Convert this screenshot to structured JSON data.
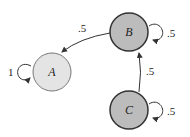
{
  "diagram": {
    "type": "markov-chain",
    "nodes": [
      {
        "id": "A",
        "label": "A",
        "fill": "#e4e4e4",
        "stroke": "#777777",
        "self_loop": "1"
      },
      {
        "id": "B",
        "label": "B",
        "fill": "#bcbcbc",
        "stroke": "#333333",
        "self_loop": ".5"
      },
      {
        "id": "C",
        "label": "C",
        "fill": "#bcbcbc",
        "stroke": "#333333",
        "self_loop": ".5"
      }
    ],
    "edges": [
      {
        "from": "B",
        "to": "A",
        "label": ".5"
      },
      {
        "from": "C",
        "to": "B",
        "label": ".5"
      }
    ]
  }
}
